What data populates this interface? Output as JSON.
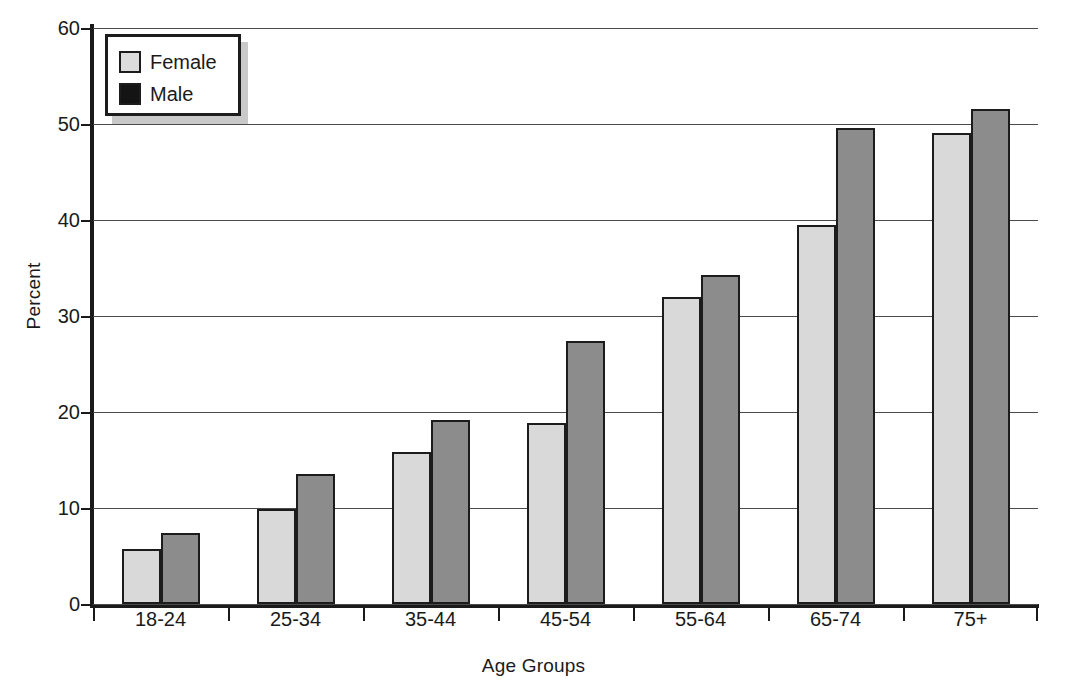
{
  "chart_data": {
    "type": "bar",
    "title": "",
    "xlabel": "Age Groups",
    "ylabel": "Percent",
    "categories": [
      "18-24",
      "25-34",
      "35-44",
      "45-54",
      "55-64",
      "65-74",
      "75+"
    ],
    "series": [
      {
        "name": "Female",
        "color": "#d9d9d9",
        "values": [
          5.7,
          9.9,
          15.8,
          18.9,
          32.0,
          39.5,
          49.1
        ]
      },
      {
        "name": "Male",
        "color": "#8c8c8c",
        "values": [
          7.4,
          13.5,
          19.2,
          27.4,
          34.3,
          49.6,
          51.6
        ]
      }
    ],
    "ylim": [
      0,
      60
    ],
    "yticks": [
      0,
      10,
      20,
      30,
      40,
      50,
      60
    ],
    "ytick_labels": [
      "0",
      "10",
      "20",
      "30",
      "40",
      "50",
      "60"
    ],
    "grid": "horizontal",
    "legend_position": "top-left",
    "legend_entries": [
      {
        "label": "Female",
        "swatch": "light-gray"
      },
      {
        "label": "Male",
        "swatch": "black"
      }
    ]
  }
}
